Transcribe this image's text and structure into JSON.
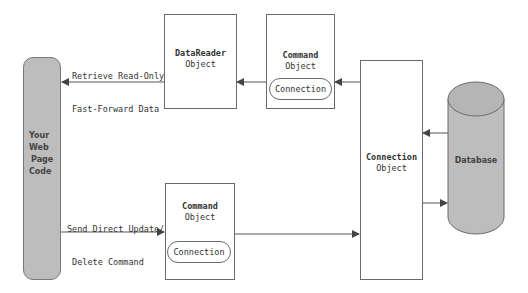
{
  "diagram": {
    "web_page_code": {
      "lines": [
        "Your",
        "Web",
        "Page",
        "Code"
      ]
    },
    "datareader": {
      "title": "DataReader",
      "subtitle": "Object"
    },
    "command_top": {
      "title": "Command",
      "subtitle": "Object",
      "inner": "Connection"
    },
    "command_bottom": {
      "title": "Command",
      "subtitle": "Object",
      "inner": "Connection"
    },
    "connection": {
      "title": "Connection",
      "subtitle": "Object"
    },
    "database": {
      "label": "Database"
    },
    "arrows": {
      "retrieve": {
        "line1": "Retrieve Read-Only",
        "line2": "Fast-Forward Data"
      },
      "send": {
        "line1": "Send Direct Update/",
        "line2": " Delete Command"
      }
    },
    "colors": {
      "fill_gray": "#bdbdbd",
      "stroke": "#6a6a6a",
      "arrow": "#444444"
    }
  }
}
